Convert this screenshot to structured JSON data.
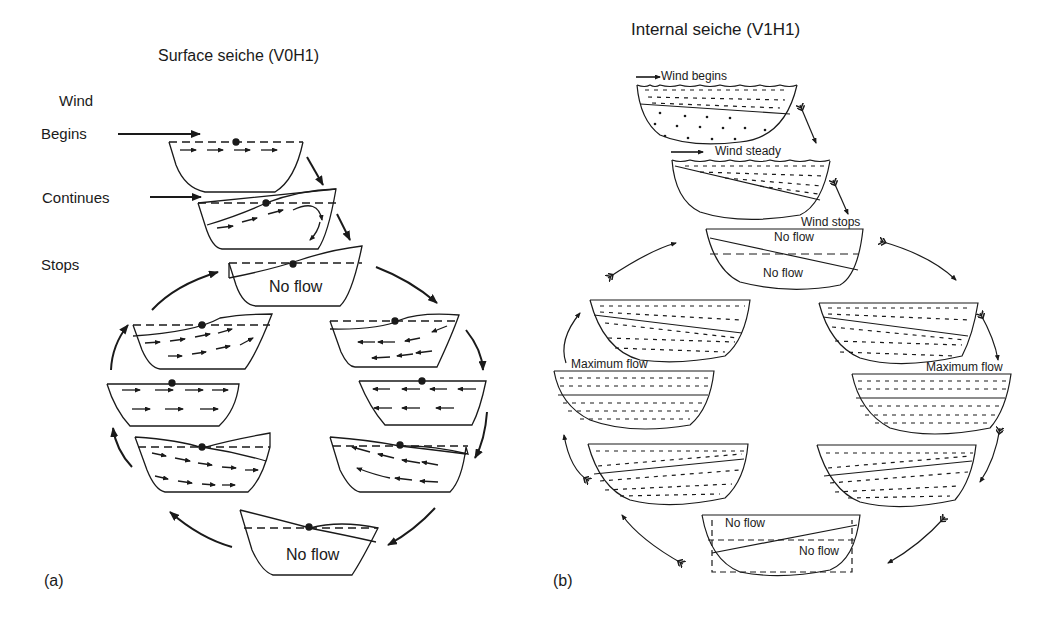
{
  "panel_a": {
    "title": "Surface seiche (V0H1)",
    "wind_label": "Wind",
    "steps": [
      "Begins",
      "Continues",
      "Stops"
    ],
    "no_flow_labels": [
      "No flow",
      "No flow"
    ],
    "panel_label": "(a)"
  },
  "panel_b": {
    "title": "Internal seiche (V1H1)",
    "wind_begins": "Wind begins",
    "wind_steady": "Wind steady",
    "wind_stops": "Wind stops",
    "no_flow_top": "No flow",
    "no_flow_bottom": "No flow",
    "max_flow_left": "Maximum flow",
    "max_flow_right": "Maximum flow",
    "no_flow_last_top": "No flow",
    "no_flow_last_bottom": "No flow",
    "panel_label": "(b)"
  },
  "colors": {
    "ink": "#1a1a1a",
    "background": "#ffffff"
  }
}
